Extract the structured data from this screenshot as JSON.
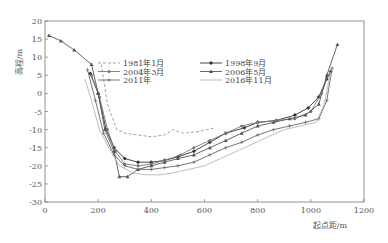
{
  "chart_data": {
    "type": "line",
    "title": "",
    "xlabel": "起点距/m",
    "ylabel": "高程/m",
    "xlim": [
      0,
      1200
    ],
    "ylim": [
      -30,
      20
    ],
    "xticks": [
      0,
      200,
      400,
      600,
      800,
      1000,
      1200
    ],
    "yticks": [
      20,
      15,
      10,
      5,
      0,
      -5,
      -10,
      -15,
      -20,
      -25,
      -30
    ],
    "grid": false,
    "legend_position": "upper-center-inside",
    "series": [
      {
        "name": "1981年1月",
        "style": "dashed",
        "color": "#999999",
        "marker": "none",
        "x": [
          212,
          235,
          270,
          300,
          350,
          400,
          450,
          480,
          520,
          580,
          640
        ],
        "y": [
          8,
          -3,
          -10,
          -11,
          -11.5,
          -12,
          -11.5,
          -10,
          -11,
          -10.5,
          -9.5
        ]
      },
      {
        "name": "1998年9月",
        "style": "solid",
        "color": "#333333",
        "marker": "diamond",
        "x": [
          170,
          200,
          230,
          260,
          300,
          350,
          400,
          450,
          500,
          560,
          620,
          680,
          750,
          800,
          870,
          940,
          990,
          1030,
          1060,
          1075
        ],
        "y": [
          5.5,
          0,
          -10,
          -15,
          -18,
          -19,
          -19,
          -18.5,
          -17.5,
          -16,
          -13.5,
          -11,
          -9.5,
          -8,
          -7.5,
          -6,
          -4,
          -1,
          4,
          6
        ]
      },
      {
        "name": "2004年3月",
        "style": "solid",
        "color": "#777777",
        "marker": "circle",
        "x": [
          175,
          205,
          235,
          265,
          300,
          350,
          400,
          450,
          510,
          560,
          620,
          680,
          740,
          800,
          870,
          940,
          1000,
          1040,
          1065
        ],
        "y": [
          5,
          -1,
          -10,
          -16,
          -19.5,
          -20,
          -19.5,
          -18.5,
          -17,
          -15,
          -13,
          -11,
          -9,
          -8,
          -7.5,
          -7,
          -5,
          0,
          5
        ]
      },
      {
        "name": "2006年5月",
        "style": "solid",
        "color": "#555555",
        "marker": "triangle",
        "x": [
          15,
          60,
          110,
          175,
          200,
          225,
          260,
          280,
          310,
          350,
          400,
          450,
          500,
          560,
          620,
          680,
          740,
          800,
          860,
          920,
          980,
          1030,
          1060,
          1100
        ],
        "y": [
          16,
          14.5,
          12,
          8,
          0,
          -10,
          -16,
          -23,
          -23,
          -21,
          -20,
          -19,
          -18,
          -17,
          -15,
          -13,
          -11,
          -9,
          -8,
          -7,
          -6,
          -3,
          5,
          13.5
        ]
      },
      {
        "name": "2011年",
        "style": "solid",
        "color": "#666666",
        "marker": "plus",
        "x": [
          160,
          190,
          220,
          260,
          300,
          350,
          400,
          450,
          500,
          560,
          620,
          680,
          740,
          800,
          860,
          920,
          980,
          1030,
          1060,
          1080
        ],
        "y": [
          6.5,
          -2,
          -11,
          -17,
          -20,
          -21,
          -21,
          -20.5,
          -20,
          -19,
          -17,
          -15,
          -13.5,
          -11.5,
          -10,
          -9,
          -8,
          -7,
          -2,
          7
        ]
      },
      {
        "name": "2016年11月",
        "style": "solid",
        "color": "#b5b5b5",
        "marker": "none",
        "x": [
          150,
          175,
          205,
          240,
          280,
          330,
          380,
          430,
          480,
          540,
          600,
          660,
          720,
          780,
          840,
          900,
          960,
          1020,
          1050,
          1075
        ],
        "y": [
          4,
          -2,
          -10,
          -15,
          -20,
          -22,
          -22.5,
          -22.5,
          -22,
          -21,
          -20,
          -18,
          -16,
          -14,
          -12,
          -10,
          -9,
          -8,
          -3,
          6
        ]
      }
    ]
  }
}
